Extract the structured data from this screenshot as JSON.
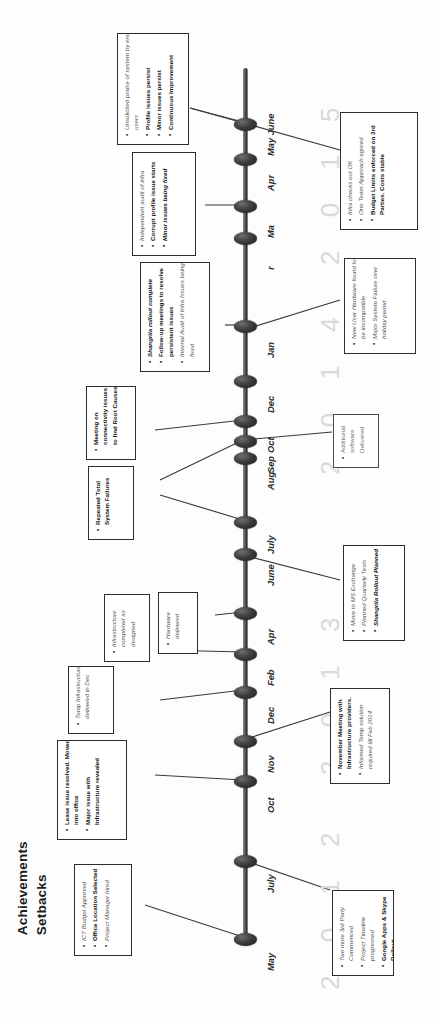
{
  "page": {
    "title_line1": "Achievements",
    "title_line2": "Setbacks"
  },
  "timeline": {
    "orientation": "vertical-rotated",
    "years": [
      {
        "label": "2 0 1 5",
        "top": 75
      },
      {
        "label": "2 0 1 4",
        "top": 285
      },
      {
        "label": "2 0 1 3",
        "top": 585
      },
      {
        "label": "2 0 1 2",
        "top": 800
      }
    ],
    "nodes": [
      {
        "month": "May June",
        "top": 118
      },
      {
        "month": "Apr",
        "top": 153
      },
      {
        "month": "Ma",
        "top": 200
      },
      {
        "month": "r",
        "top": 232
      },
      {
        "month": "Jan",
        "top": 320
      },
      {
        "month": "Dec",
        "top": 375
      },
      {
        "month": "Oct",
        "top": 415
      },
      {
        "month": "Sep",
        "top": 435
      },
      {
        "month": "Aug",
        "top": 452
      },
      {
        "month": "July",
        "top": 516
      },
      {
        "month": "June",
        "top": 548
      },
      {
        "month": "Apr",
        "top": 607
      },
      {
        "month": "Feb",
        "top": 648
      },
      {
        "month": "Dec",
        "top": 686
      },
      {
        "month": "Nov",
        "top": 735
      },
      {
        "month": "Oct",
        "top": 775
      },
      {
        "month": "July",
        "top": 855
      },
      {
        "month": "May",
        "top": 933
      }
    ]
  },
  "callouts": [
    {
      "id": "praise-2015",
      "side": "left",
      "items": [
        {
          "text": "Unsolicited praise of system by end users",
          "style": "i"
        },
        {
          "text": "Profile issues persist",
          "style": "b"
        },
        {
          "text": "Minor issues persist",
          "style": "b"
        },
        {
          "text": "Continuous Improvement",
          "style": "b"
        }
      ]
    },
    {
      "id": "audit-2015",
      "side": "left",
      "items": [
        {
          "text": "Independent audit of infra",
          "style": "i"
        },
        {
          "text": "Corrupt profile issue starts",
          "style": "b"
        },
        {
          "text": "Minor issues being fixed",
          "style": "bi"
        }
      ]
    },
    {
      "id": "infra-checks-2015",
      "side": "right",
      "items": [
        {
          "text": "Infra checks out OK",
          "style": "i"
        },
        {
          "text": "One Team Approach agreed",
          "style": "i"
        },
        {
          "text": "Budget Limits enforced on 3rd Parties. Costs stable",
          "style": "b"
        }
      ]
    },
    {
      "id": "shangrila-rollout",
      "side": "left",
      "items": [
        {
          "text": "Shangrila rollout complete",
          "style": "bi"
        },
        {
          "text": "Follow-up meetings to resolve persistent issues",
          "style": "b"
        },
        {
          "text": "Internal Audit of Infra Issues being fixed",
          "style": "i"
        }
      ]
    },
    {
      "id": "hardware-failure-2014",
      "side": "right",
      "items": [
        {
          "text": "New User Hardware found to be incompatible",
          "style": "i"
        },
        {
          "text": "Major System Failure over holiday period",
          "style": "i"
        }
      ]
    },
    {
      "id": "meeting-root-causes",
      "side": "left",
      "items": [
        {
          "text": "Meeting on connectivity issues to find Root Causes",
          "style": "b"
        }
      ]
    },
    {
      "id": "additional-software",
      "side": "right",
      "items": [
        {
          "text": "Additional software Delivered",
          "style": "lt"
        }
      ]
    },
    {
      "id": "repeated-failures",
      "side": "left",
      "items": [
        {
          "text": "Repeated Total System Failures",
          "style": "b"
        }
      ]
    },
    {
      "id": "move-to-ms-exchange",
      "side": "right",
      "items": [
        {
          "text": "Move to MS Exchange",
          "style": "i"
        },
        {
          "text": "Planned Quarterly Tests",
          "style": "i"
        },
        {
          "text": "Shangrila Rollout Planned",
          "style": "bi"
        }
      ]
    },
    {
      "id": "hardware-delivered",
      "side": "left",
      "items": [
        {
          "text": "Hardware delivered",
          "style": "i"
        }
      ]
    },
    {
      "id": "infra-complete",
      "side": "left",
      "items": [
        {
          "text": "Infrastructure completed as designed",
          "style": "i"
        }
      ]
    },
    {
      "id": "temp-infra-dec",
      "side": "left",
      "items": [
        {
          "text": "Temp Infrastructure delivered in Dec",
          "style": "i"
        }
      ]
    },
    {
      "id": "november-meeting",
      "side": "right",
      "items": [
        {
          "text": "November Meeting with Infrastructure providers.",
          "style": "b"
        },
        {
          "text": "Informed Temp solution required till Feb 2014",
          "style": "i"
        }
      ]
    },
    {
      "id": "lease-issue",
      "side": "left",
      "items": [
        {
          "text": "Lease issue resolved. Moved into office",
          "style": "b"
        },
        {
          "text": "Major issue with Infrastructure revealed",
          "style": "b"
        }
      ]
    },
    {
      "id": "third-party-commenced",
      "side": "right",
      "items": [
        {
          "text": "Two more 3rd Party Commenced",
          "style": "i"
        },
        {
          "text": "Project Timeline progressed",
          "style": "i"
        },
        {
          "text": "Google Apps & Skype Rollout",
          "style": "b"
        }
      ]
    },
    {
      "id": "ict-budget",
      "side": "left",
      "items": [
        {
          "text": "ICT Budget Approved",
          "style": "i"
        },
        {
          "text": "Office Location Selected",
          "style": "b"
        },
        {
          "text": "Project Manager hired",
          "style": "i"
        }
      ]
    }
  ]
}
